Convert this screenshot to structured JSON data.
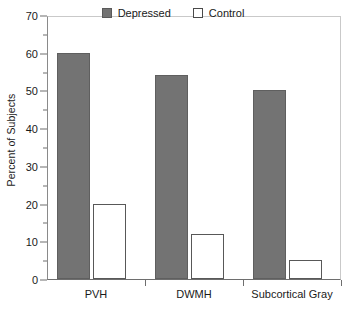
{
  "chart_data": {
    "type": "bar",
    "title": "",
    "xlabel": "",
    "ylabel": "Percent of Subjects",
    "categories": [
      "PVH",
      "DWMH",
      "Subcortical Gray"
    ],
    "series": [
      {
        "name": "Depressed",
        "values": [
          60,
          54,
          50
        ],
        "color": "#737373"
      },
      {
        "name": "Control",
        "values": [
          20,
          12,
          5
        ],
        "color": "#ffffff"
      }
    ],
    "ylim": [
      0,
      70
    ],
    "y_major_ticks": [
      0,
      10,
      20,
      30,
      40,
      50,
      60,
      70
    ],
    "y_minor_ticks": [
      5,
      15,
      25,
      35,
      45,
      55,
      65
    ],
    "y_tick_labels": [
      "0",
      "10",
      "20",
      "30",
      "40",
      "50",
      "60",
      "70"
    ],
    "grid": false,
    "legend_position": "top-center",
    "legend_entries": [
      "Depressed",
      "Control"
    ]
  },
  "axis": {
    "y_title": "Percent of Subjects"
  },
  "legend": {
    "items": [
      {
        "label": "Depressed",
        "swatch": "filled-gray-square"
      },
      {
        "label": "Control",
        "swatch": "open-white-square"
      }
    ]
  }
}
